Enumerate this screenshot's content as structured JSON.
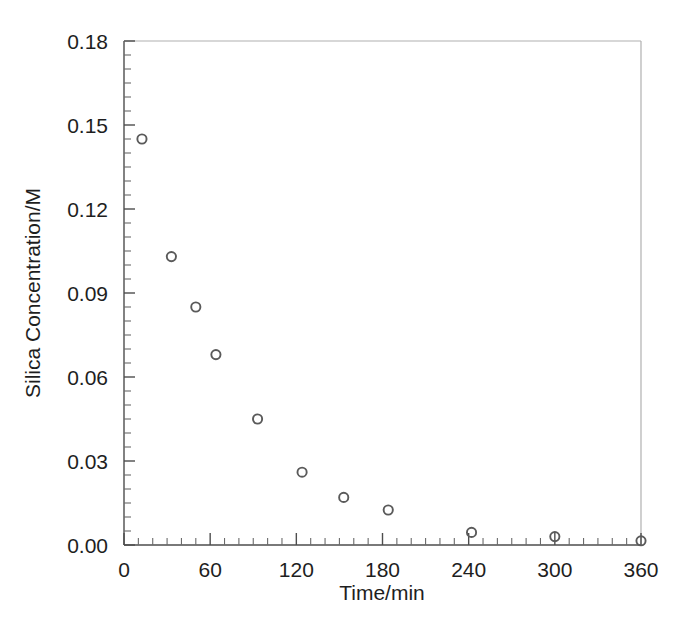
{
  "chart_data": {
    "type": "scatter",
    "title": "",
    "xlabel": "Time/min",
    "ylabel": "Silica Concentration/M",
    "xlim": [
      0,
      360
    ],
    "ylim": [
      0.0,
      0.18
    ],
    "grid": false,
    "legend": "none",
    "marker": "open-circle",
    "marker_color": "#5a5a5a",
    "x_major_ticks": [
      0,
      60,
      120,
      180,
      240,
      300,
      360
    ],
    "x_tick_labels": [
      "0",
      "60",
      "120",
      "180",
      "240",
      "300",
      "360"
    ],
    "x_minor_interval": 10,
    "y_major_ticks": [
      0.0,
      0.03,
      0.06,
      0.09,
      0.12,
      0.15,
      0.18
    ],
    "y_tick_labels": [
      "0.00",
      "0.03",
      "0.06",
      "0.09",
      "0.12",
      "0.15",
      "0.18"
    ],
    "y_minor_interval": 0.005,
    "series": [
      {
        "name": "Silica Concentration",
        "x": [
          12.5,
          33,
          50,
          64,
          93,
          124,
          153,
          184,
          242,
          300,
          360
        ],
        "values": [
          0.145,
          0.103,
          0.085,
          0.068,
          0.045,
          0.026,
          0.017,
          0.0125,
          0.0045,
          0.003,
          0.0015
        ]
      }
    ]
  },
  "axes": {
    "x_title": "Time/min",
    "y_title": "Silica Concentration/M",
    "x_last_label_clipped": "360"
  }
}
